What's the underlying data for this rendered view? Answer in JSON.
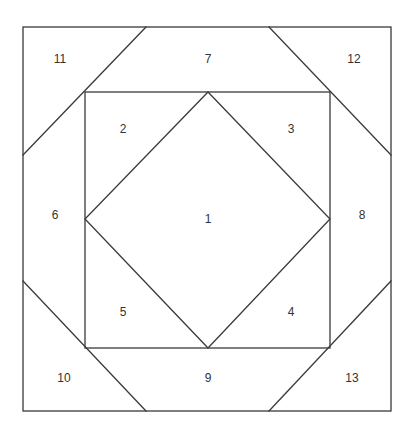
{
  "diagram": {
    "title": "",
    "stroke_color": "#3a3a3a",
    "label_color": "#333333",
    "background": "#ffffff",
    "outer_square": {
      "x1": 23,
      "y1": 27,
      "x2": 391,
      "y2": 411
    },
    "inner_square": {
      "x1": 85,
      "y1": 92,
      "x2": 330,
      "y2": 348
    },
    "diamond": {
      "top": [
        208,
        92
      ],
      "right": [
        330,
        219
      ],
      "bottom": [
        208,
        348
      ],
      "left": [
        85,
        219
      ]
    },
    "corner_lines": [
      {
        "name": "top-left",
        "from": [
          146,
          27
        ],
        "to": [
          23,
          155
        ]
      },
      {
        "name": "top-right",
        "from": [
          269,
          27
        ],
        "to": [
          391,
          155
        ]
      },
      {
        "name": "bottom-left",
        "from": [
          23,
          281
        ],
        "to": [
          146,
          411
        ]
      },
      {
        "name": "bottom-right",
        "from": [
          391,
          281
        ],
        "to": [
          269,
          411
        ]
      }
    ],
    "regions": [
      {
        "id": "1",
        "label": "1",
        "x": 208,
        "y": 219
      },
      {
        "id": "2",
        "label": "2",
        "x": 123,
        "y": 129
      },
      {
        "id": "3",
        "label": "3",
        "x": 291,
        "y": 129
      },
      {
        "id": "4",
        "label": "4",
        "x": 291,
        "y": 312
      },
      {
        "id": "5",
        "label": "5",
        "x": 123,
        "y": 312
      },
      {
        "id": "6",
        "label": "6",
        "x": 55,
        "y": 215
      },
      {
        "id": "7",
        "label": "7",
        "x": 208,
        "y": 59
      },
      {
        "id": "8",
        "label": "8",
        "x": 362,
        "y": 215
      },
      {
        "id": "9",
        "label": "9",
        "x": 208,
        "y": 378
      },
      {
        "id": "10",
        "label": "10",
        "x": 64,
        "y": 378
      },
      {
        "id": "11",
        "label": "11",
        "x": 60,
        "y": 59
      },
      {
        "id": "12",
        "label": "12",
        "x": 354,
        "y": 59
      },
      {
        "id": "13",
        "label": "13",
        "x": 352,
        "y": 378
      }
    ]
  }
}
